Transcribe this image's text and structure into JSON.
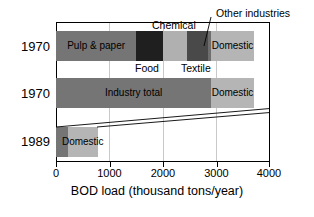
{
  "chart_data": {
    "type": "bar",
    "orientation": "horizontal",
    "stacked": true,
    "title": "",
    "xlabel": "BOD load (thousand tons/year)",
    "ylabel": "",
    "xlim": [
      0,
      4000
    ],
    "xticks": [
      0,
      1000,
      2000,
      3000,
      4000
    ],
    "xticklabels": [
      "0",
      "1000",
      "2000",
      "3000",
      "4000"
    ],
    "categories": [
      "1970",
      "1970",
      "1989"
    ],
    "grid": true,
    "grid_axis": "x",
    "legend": "none",
    "annotations": [
      {
        "text": "Chemical",
        "target": "1970-detail.chemical"
      },
      {
        "text": "Food",
        "target": "1970-detail.food"
      },
      {
        "text": "Textile",
        "target": "1970-detail.textile"
      },
      {
        "text": "Other industries",
        "target": "1970-detail.other_industries"
      }
    ],
    "rows": [
      {
        "category": "1970",
        "row_name": "1970-detail",
        "total": 3700,
        "segments": [
          {
            "name": "Pulp & paper",
            "label": "Pulp & paper",
            "start": 0,
            "end": 1500,
            "value": 1500,
            "color": "#757575",
            "label_inside": true
          },
          {
            "name": "Food",
            "label": "",
            "start": 1500,
            "end": 2000,
            "value": 500,
            "color": "#1f1f1f",
            "label_inside": false
          },
          {
            "name": "Chemical",
            "label": "",
            "start": 2000,
            "end": 2450,
            "value": 450,
            "color": "#b0b0b0",
            "label_inside": false
          },
          {
            "name": "Textile",
            "label": "",
            "start": 2450,
            "end": 2840,
            "value": 390,
            "color": "#494949",
            "label_inside": false
          },
          {
            "name": "Other industries",
            "label": "",
            "start": 2840,
            "end": 2900,
            "value": 60,
            "color": "#6e6e6e",
            "label_inside": false
          },
          {
            "name": "Domestic",
            "label": "Domestic",
            "start": 2900,
            "end": 3700,
            "value": 800,
            "color": "#b5b5b5",
            "label_inside": true
          }
        ]
      },
      {
        "category": "1970",
        "row_name": "1970-total",
        "total": 3700,
        "segments": [
          {
            "name": "Industry total",
            "label": "Industry total",
            "start": 0,
            "end": 2900,
            "value": 2900,
            "color": "#757575",
            "label_inside": true
          },
          {
            "name": "Domestic",
            "label": "Domestic",
            "start": 2900,
            "end": 3700,
            "value": 800,
            "color": "#b5b5b5",
            "label_inside": true
          }
        ]
      },
      {
        "category": "1989",
        "row_name": "1989-total",
        "total": 780,
        "segments": [
          {
            "name": "Industry total",
            "label": "",
            "start": 0,
            "end": 220,
            "value": 220,
            "color": "#757575",
            "label_inside": false
          },
          {
            "name": "Domestic",
            "label": "Domestic",
            "start": 220,
            "end": 780,
            "value": 560,
            "color": "#b5b5b5",
            "label_inside": true
          }
        ]
      }
    ]
  },
  "axis": {
    "x_title": "BOD load (thousand tons/year)",
    "tick_0": "0",
    "tick_1000": "1000",
    "tick_2000": "2000",
    "tick_3000": "3000",
    "tick_4000": "4000"
  },
  "years": {
    "row1": "1970",
    "row2": "1970",
    "row3": "1989"
  },
  "labels": {
    "pulp_paper": "Pulp & paper",
    "food": "Food",
    "chemical": "Chemical",
    "textile": "Textile",
    "other_industries": "Other industries",
    "domestic_1": "Domestic",
    "industry_total": "Industry total",
    "domestic_2": "Domestic",
    "domestic_3": "Domestic"
  },
  "colors": {
    "industry": "#757575",
    "domestic": "#b5b5b5",
    "food": "#1f1f1f",
    "chemical": "#b0b0b0",
    "textile": "#494949",
    "other": "#6e6e6e",
    "frame": "#000000",
    "grid": "#c9c9c9"
  }
}
